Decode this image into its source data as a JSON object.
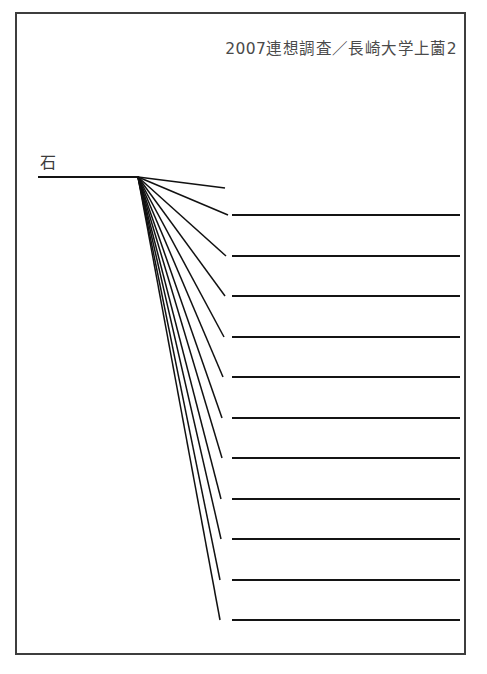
{
  "page": {
    "title": "2007連想調査／長崎大学上薗2",
    "background_color": "#ffffff",
    "border_color": "#3d3d3d",
    "line_color": "#141414",
    "width": 487,
    "height": 674
  },
  "header": {
    "survey_year": "2007",
    "survey_label": "2007連想調査／長崎大学上薗2"
  },
  "root": {
    "label": "石",
    "x": 138,
    "y": 177
  },
  "chart_data": {
    "type": "diagram",
    "diagram_kind": "word-association-fan-tree",
    "title": "2007連想調査／長崎大学上薗2",
    "root_node": "石",
    "node_count": 12,
    "branch_count": 11,
    "branches": [
      {
        "index": 1,
        "label": "",
        "end_x": 225,
        "end_y": 188,
        "has_horizontal": false
      },
      {
        "index": 2,
        "label": "",
        "end_x": 228,
        "end_y": 215,
        "has_horizontal": true
      },
      {
        "index": 3,
        "label": "",
        "end_x": 226,
        "end_y": 256,
        "has_horizontal": true
      },
      {
        "index": 4,
        "label": "",
        "end_x": 225,
        "end_y": 296,
        "has_horizontal": true
      },
      {
        "index": 5,
        "label": "",
        "end_x": 224,
        "end_y": 337,
        "has_horizontal": true
      },
      {
        "index": 6,
        "label": "",
        "end_x": 223,
        "end_y": 377,
        "has_horizontal": true
      },
      {
        "index": 7,
        "label": "",
        "end_x": 222,
        "end_y": 418,
        "has_horizontal": true
      },
      {
        "index": 8,
        "label": "",
        "end_x": 222,
        "end_y": 458,
        "has_horizontal": true
      },
      {
        "index": 9,
        "label": "",
        "end_x": 221,
        "end_y": 499,
        "has_horizontal": true
      },
      {
        "index": 10,
        "label": "",
        "end_x": 221,
        "end_y": 539,
        "has_horizontal": true
      },
      {
        "index": 11,
        "label": "",
        "end_x": 220,
        "end_y": 580,
        "has_horizontal": true
      },
      {
        "index": 12,
        "label": "",
        "end_x": 220,
        "end_y": 620,
        "has_horizontal": true
      }
    ],
    "horizontal_segments": [
      {
        "index": 1,
        "y": 215,
        "x_start": 232,
        "x_end": 460,
        "label": ""
      },
      {
        "index": 2,
        "y": 256,
        "x_start": 232,
        "x_end": 460,
        "label": ""
      },
      {
        "index": 3,
        "y": 296,
        "x_start": 232,
        "x_end": 460,
        "label": ""
      },
      {
        "index": 4,
        "y": 337,
        "x_start": 232,
        "x_end": 460,
        "label": ""
      },
      {
        "index": 5,
        "y": 377,
        "x_start": 232,
        "x_end": 460,
        "label": ""
      },
      {
        "index": 6,
        "y": 418,
        "x_start": 232,
        "x_end": 460,
        "label": ""
      },
      {
        "index": 7,
        "y": 458,
        "x_start": 232,
        "x_end": 460,
        "label": ""
      },
      {
        "index": 8,
        "y": 499,
        "x_start": 232,
        "x_end": 460,
        "label": ""
      },
      {
        "index": 9,
        "y": 539,
        "x_start": 232,
        "x_end": 460,
        "label": ""
      },
      {
        "index": 10,
        "y": 580,
        "x_start": 232,
        "x_end": 460,
        "label": ""
      },
      {
        "index": 11,
        "y": 620,
        "x_start": 232,
        "x_end": 460,
        "label": ""
      }
    ],
    "root_underline": {
      "x_start": 38,
      "x_end": 138,
      "y": 177
    }
  }
}
